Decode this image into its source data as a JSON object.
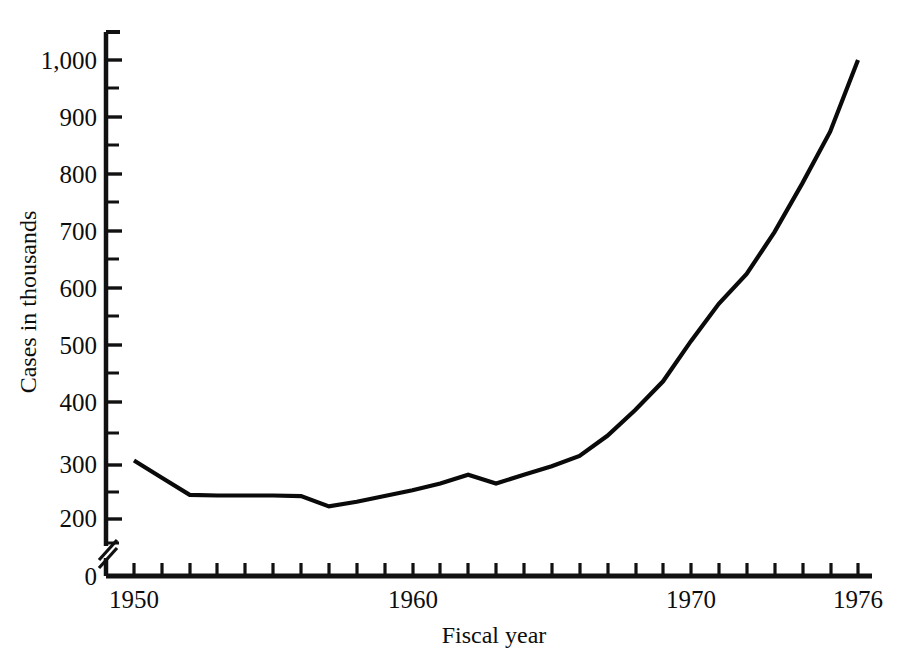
{
  "chart_data": {
    "type": "line",
    "title": "",
    "xlabel": "Fiscal year",
    "ylabel": "Cases in thousands",
    "xlim": [
      1950,
      1976
    ],
    "ylim": [
      0,
      1000
    ],
    "y_axis_break": true,
    "y_break_between": [
      0,
      180
    ],
    "grid": false,
    "legend": null,
    "x_tick_labels": [
      "1950",
      "1960",
      "1970",
      "1976"
    ],
    "x_tick_label_values": [
      1950,
      1960,
      1970,
      1976
    ],
    "x_minor_ticks_every": 1,
    "y_tick_labels": [
      "0",
      "200",
      "300",
      "400",
      "500",
      "600",
      "700",
      "800",
      "900",
      "1,000"
    ],
    "y_tick_label_values": [
      0,
      200,
      300,
      400,
      500,
      600,
      700,
      800,
      900,
      1000
    ],
    "y_minor_ticks_every": 50,
    "line_color": "#0a0a0a",
    "x": [
      1950,
      1951,
      1952,
      1953,
      1954,
      1955,
      1956,
      1957,
      1958,
      1959,
      1960,
      1961,
      1962,
      1963,
      1964,
      1965,
      1966,
      1967,
      1968,
      1969,
      1970,
      1971,
      1972,
      1973,
      1974,
      1975,
      1976
    ],
    "values": [
      302,
      272,
      242,
      241,
      241,
      241,
      240,
      222,
      230,
      240,
      250,
      262,
      277,
      262,
      277,
      292,
      310,
      345,
      390,
      440,
      510,
      575,
      627,
      700,
      785,
      875,
      1000
    ],
    "series": [
      {
        "name": "Cases",
        "values": [
          302,
          272,
          242,
          241,
          241,
          241,
          240,
          222,
          230,
          240,
          250,
          262,
          277,
          262,
          277,
          292,
          310,
          345,
          390,
          440,
          510,
          575,
          627,
          700,
          785,
          875,
          1000
        ]
      }
    ],
    "annotations": []
  },
  "axes": {
    "y_title": "Cases in thousands",
    "x_title": "Fiscal year"
  }
}
